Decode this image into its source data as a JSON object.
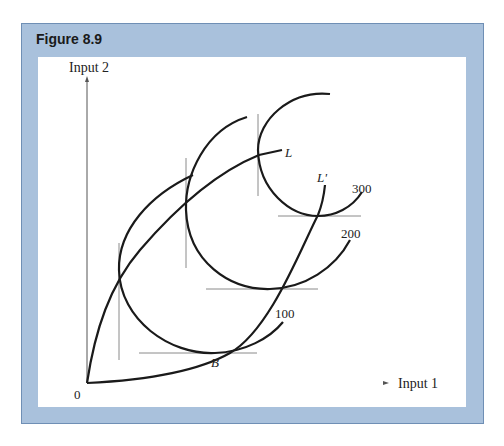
{
  "figure": {
    "title": "Figure 8.9"
  },
  "axes": {
    "y_label": "Input 2",
    "x_label": "Input 1",
    "origin_label": "0"
  },
  "curves": {
    "isoquant_labels": [
      "100",
      "200",
      "300"
    ],
    "expansion_path_labels": [
      "L",
      "L'"
    ],
    "point_label": "B"
  },
  "colors": {
    "panel_bg": "#a9c1dc",
    "panel_border": "#6f8fb5",
    "curve": "#1a1a1a",
    "tangent": "#888888"
  }
}
